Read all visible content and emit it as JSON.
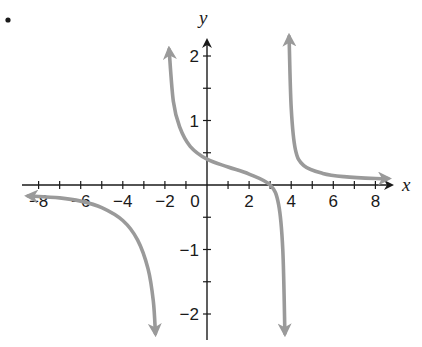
{
  "chart_data": {
    "type": "line",
    "title": "",
    "xlabel": "x",
    "ylabel": "y",
    "xlim": [
      -9,
      9
    ],
    "ylim": [
      -2.3,
      2.3
    ],
    "grid": false,
    "x_ticks": [
      -8,
      -7,
      -6,
      -5,
      -4,
      -3,
      -2,
      -1,
      0,
      1,
      2,
      3,
      4,
      5,
      6,
      7,
      8
    ],
    "x_tick_labels": [
      "-8",
      "-6",
      "-4",
      "-2",
      "0",
      "2",
      "4",
      "6",
      "8"
    ],
    "y_ticks": [
      -2,
      -1.5,
      -1,
      -0.5,
      0.5,
      1,
      1.5,
      2
    ],
    "y_tick_labels": [
      "-2",
      "-1",
      "1",
      "2"
    ],
    "curve_color": "#9a9a9a",
    "axis_color": "#1a1a1a",
    "series": [
      {
        "name": "left branch",
        "points": [
          [
            -8.5,
            -0.17
          ],
          [
            -7,
            -0.2
          ],
          [
            -6,
            -0.25
          ],
          [
            -5,
            -0.35
          ],
          [
            -4,
            -0.55
          ],
          [
            -3.3,
            -0.85
          ],
          [
            -2.8,
            -1.3
          ],
          [
            -2.55,
            -1.8
          ],
          [
            -2.45,
            -2.3
          ]
        ],
        "end_arrows": [
          "left",
          "down"
        ]
      },
      {
        "name": "middle branch",
        "points": [
          [
            -1.8,
            2.1
          ],
          [
            -1.6,
            1.3
          ],
          [
            -1.3,
            0.9
          ],
          [
            -0.8,
            0.6
          ],
          [
            0,
            0.4
          ],
          [
            1,
            0.28
          ],
          [
            2,
            0.17
          ],
          [
            3,
            0
          ],
          [
            3.4,
            -0.3
          ],
          [
            3.6,
            -1.0
          ],
          [
            3.7,
            -2.3
          ]
        ],
        "end_arrows": [
          "up",
          "down"
        ]
      },
      {
        "name": "right branch",
        "points": [
          [
            3.9,
            2.3
          ],
          [
            4.0,
            1.2
          ],
          [
            4.2,
            0.55
          ],
          [
            4.6,
            0.3
          ],
          [
            5.5,
            0.18
          ],
          [
            6.5,
            0.13
          ],
          [
            8,
            0.1
          ],
          [
            8.6,
            0.1
          ]
        ],
        "end_arrows": [
          "up",
          "right"
        ]
      }
    ],
    "annotations": [],
    "vertical_asymptotes_approx": [
      -2.4,
      3.75
    ],
    "x_intercept_approx": 3,
    "y_intercept_approx": 0.4
  },
  "figure": {
    "marker": "•",
    "x_axis_label": "x",
    "y_axis_label": "y",
    "x_labels": [
      {
        "text": "−8",
        "value": -8
      },
      {
        "text": "−6",
        "value": -6
      },
      {
        "text": "−4",
        "value": -4
      },
      {
        "text": "−2",
        "value": -2
      },
      {
        "text": "0",
        "value": 0
      },
      {
        "text": "2",
        "value": 2
      },
      {
        "text": "4",
        "value": 4
      },
      {
        "text": "6",
        "value": 6
      },
      {
        "text": "8",
        "value": 8
      }
    ],
    "y_labels": [
      {
        "text": "2",
        "value": 2
      },
      {
        "text": "1",
        "value": 1
      },
      {
        "text": "−1",
        "value": -1
      },
      {
        "text": "−2",
        "value": -2
      }
    ]
  }
}
